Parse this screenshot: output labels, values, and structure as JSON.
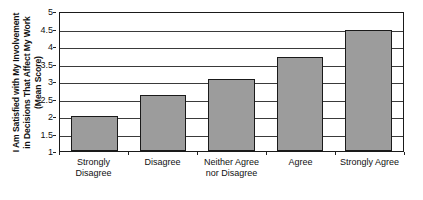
{
  "chart_data": {
    "type": "bar",
    "title": "",
    "subtitle": "",
    "xlabel": "",
    "ylabel": "I Am Satisfied with My Involvement in Decisions That Affect My Work (Mean Score)",
    "ylabel_lines": [
      "I Am Satisfied with My Involvement",
      "in Decisions That Affect My Work",
      "(Mean Score)"
    ],
    "categories": [
      "Strongly Disagree",
      "Disagree",
      "Neither Agree nor Disagree",
      "Agree",
      "Strongly Agree"
    ],
    "category_lines": [
      [
        "Strongly",
        "Disagree"
      ],
      [
        "Disagree",
        ""
      ],
      [
        "Neither Agree",
        "nor Disagree"
      ],
      [
        "Agree",
        ""
      ],
      [
        "Strongly Agree",
        ""
      ]
    ],
    "values": [
      2.0,
      2.6,
      3.05,
      3.7,
      4.45
    ],
    "ylim": [
      1,
      5
    ],
    "yticks": [
      5,
      4.5,
      4,
      3.5,
      3,
      2.5,
      2,
      1.5,
      1
    ],
    "ytick_labels": [
      "5",
      "4.5",
      "4",
      "3.5",
      "3",
      "2.5",
      "2",
      "1.5",
      "1"
    ],
    "grid": true,
    "grid_axis": "y",
    "legend": false,
    "legend_position": "none",
    "bar_color": "#9c9c9c",
    "bar_edge_color": "#1a1a1a",
    "frame_color": "#1a1a1a",
    "background": "#ffffff"
  }
}
